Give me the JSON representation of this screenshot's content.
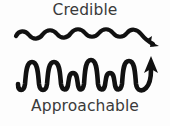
{
  "diagram": {
    "title_top": "Credible",
    "title_bottom": "Approachable",
    "background_color": "#fdfdfd",
    "ink_color": "#111111",
    "text_color": "#3a3a3a",
    "width": 170,
    "height": 126
  },
  "labels": {
    "top": "Credible",
    "bottom": "Approachable"
  },
  "waves": [
    {
      "name": "credible-wave",
      "label": "Credible",
      "description": "low amplitude smooth sine wave with arrowhead pointing right and slightly down",
      "cycles": 5,
      "amplitude": 5,
      "arrow_direction": "right",
      "color": "#111111"
    },
    {
      "name": "approachable-wave",
      "label": "Approachable",
      "description": "high amplitude irregular wave with tall and short peaks, ending in an upward curling arrow",
      "cycles": 7,
      "amplitude": 16,
      "arrow_direction": "up",
      "color": "#111111"
    }
  ]
}
